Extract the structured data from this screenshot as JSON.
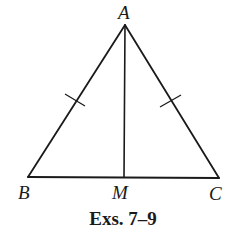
{
  "figure": {
    "caption": "Exs. 7–9",
    "stroke_color": "#1a1a1a",
    "background": "#ffffff"
  },
  "vertices": {
    "A": {
      "label": "A",
      "x": 125,
      "y": 25
    },
    "B": {
      "label": "B",
      "x": 28,
      "y": 177
    },
    "C": {
      "label": "C",
      "x": 219,
      "y": 178
    },
    "M": {
      "label": "M",
      "x": 124,
      "y": 177
    }
  },
  "segments": [
    {
      "name": "AB",
      "from": "A",
      "to": "B",
      "tick_marks": 1
    },
    {
      "name": "AC",
      "from": "A",
      "to": "C",
      "tick_marks": 1
    },
    {
      "name": "BC",
      "from": "B",
      "to": "C",
      "tick_marks": 0
    },
    {
      "name": "AM",
      "from": "A",
      "to": "M",
      "tick_marks": 0
    }
  ],
  "congruence": "AB ≅ AC"
}
